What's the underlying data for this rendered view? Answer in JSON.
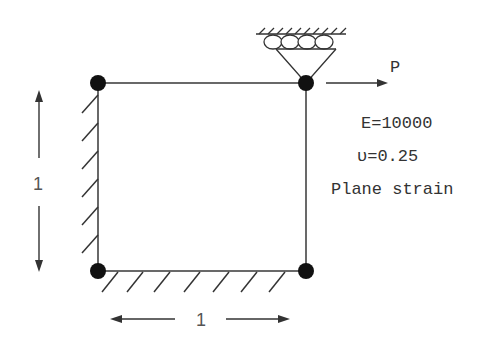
{
  "diagram": {
    "type": "finite-element-problem",
    "element": {
      "shape": "square",
      "nodes": 4
    },
    "load": {
      "label": "P",
      "direction": "right"
    },
    "properties": {
      "E": "E=10000",
      "nu": "υ=0.25",
      "condition": "Plane strain"
    },
    "dimensions": {
      "height": "1",
      "width": "1"
    },
    "supports": {
      "left_edge": "fixed",
      "bottom_edge": "fixed",
      "top_right_node": "roller"
    },
    "colors": {
      "line": "#333333",
      "node": "#111111"
    }
  }
}
